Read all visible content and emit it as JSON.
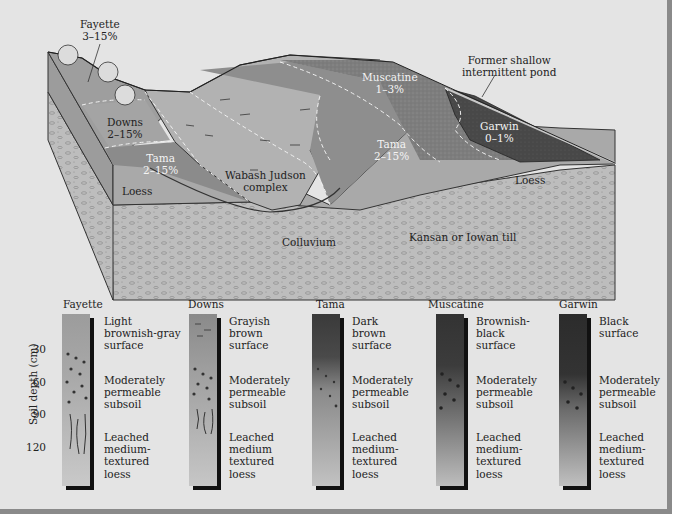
{
  "landscape": {
    "labels": {
      "fayette": {
        "name": "Fayette",
        "slope": "3–15%"
      },
      "downs": {
        "name": "Downs",
        "slope": "2–15%"
      },
      "tama_left": {
        "name": "Tama",
        "slope": "2–15%"
      },
      "wabash": {
        "line1": "Wabash Judson",
        "line2": "complex"
      },
      "muscatine": {
        "name": "Muscatine",
        "slope": "1–3%"
      },
      "tama_right": {
        "name": "Tama",
        "slope": "2–15%"
      },
      "garwin": {
        "name": "Garwin",
        "slope": "0–1%"
      },
      "pond": {
        "line1": "Former shallow",
        "line2": "intermittent pond"
      },
      "loess_left": "Loess",
      "loess_right": "Loess",
      "colluvium": "Colluvium",
      "till": "Kansan or Iowan till"
    },
    "colors": {
      "background": "#e4e4e4",
      "till": "#bdbdbd",
      "loess": "#a9a9a9",
      "fayette": "#9e9e9e",
      "downs": "#a2a2a2",
      "tama": "#8b8b8b",
      "wabash": "#b4b4b4",
      "muscatine": "#7d7d7d",
      "garwin": "#4a4a4a"
    }
  },
  "profiles": {
    "y_axis_label": "Soil depth (cm)",
    "ticks": [
      "30",
      "60",
      "90",
      "120"
    ],
    "items": [
      {
        "name": "Fayette",
        "surface": [
          "Light",
          "brownish-gray",
          "surface"
        ],
        "subsoil": [
          "Moderately",
          "permeable",
          "subsoil"
        ],
        "parent": [
          "Leached",
          "medium-",
          "textured",
          "loess"
        ],
        "top_color": "#9c9c9c",
        "bottom_color": "#c9c9c9"
      },
      {
        "name": "Downs",
        "surface": [
          "Grayish",
          "brown",
          "surface"
        ],
        "subsoil": [
          "Moderately",
          "permeable",
          "subsoil"
        ],
        "parent": [
          "Leached",
          "medium",
          "textured",
          "loess"
        ],
        "top_color": "#8a8a8a",
        "bottom_color": "#c6c6c6"
      },
      {
        "name": "Tama",
        "surface": [
          "Dark",
          "brown",
          "surface"
        ],
        "subsoil": [
          "Moderately",
          "permeable",
          "subsoil"
        ],
        "parent": [
          "Leached",
          "medium-",
          "textured",
          "loess"
        ],
        "top_color": "#3a3a3a",
        "bottom_color": "#c2c2c2"
      },
      {
        "name": "Muscatine",
        "surface": [
          "Brownish-",
          "black",
          "surface"
        ],
        "subsoil": [
          "Moderately",
          "permeable",
          "subsoil"
        ],
        "parent": [
          "Leached",
          "medium-",
          "textured",
          "loess"
        ],
        "top_color": "#333333",
        "bottom_color": "#bdbdbd"
      },
      {
        "name": "Garwin",
        "surface": [
          "Black",
          "surface"
        ],
        "subsoil": [
          "Moderately",
          "permeable",
          "subsoil"
        ],
        "parent": [
          "Leached",
          "medium-",
          "textured",
          "loess"
        ],
        "top_color": "#2c2c2c",
        "bottom_color": "#c0c0c0"
      }
    ]
  }
}
